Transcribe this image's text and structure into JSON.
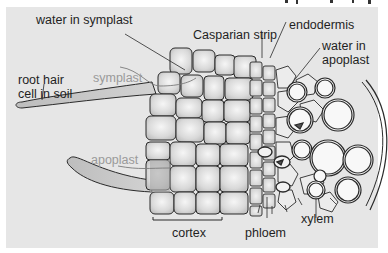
{
  "diagram": {
    "title_fragment": "",
    "labels": {
      "water_in_symplast": "water in symplast",
      "casparian_strip": "Casparian strip",
      "endodermis": "endodermis",
      "water_in_apoplast_line1": "water in",
      "water_in_apoplast_line2": "apoplast",
      "root_hair_line1": "root hair",
      "root_hair_line2": "cell in soil",
      "symplast": "symplast",
      "apoplast": "apoplast",
      "cortex": "cortex",
      "phloem": "phloem",
      "xylem": "xylem"
    },
    "colors": {
      "background": "#e6e6e6",
      "border": "#ffffff",
      "cell_fill": "#d8d8d8",
      "cell_highlight": "#f4f4f4",
      "outline": "#2a2a2a",
      "pathway_label": "#9a9a9a",
      "root_hair_fill": "#c4c4c4"
    }
  }
}
